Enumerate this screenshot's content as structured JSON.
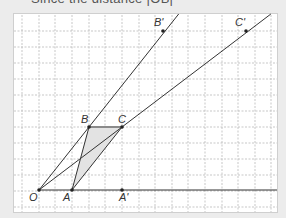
{
  "caption": "Since the distance |OB|",
  "diagram": {
    "type": "geometry-enlargement",
    "grid": {
      "x_lines": [
        22,
        39,
        55,
        72,
        89,
        105,
        122,
        139,
        155,
        172,
        188,
        205,
        222,
        238,
        255,
        271
      ],
      "y_lines": [
        31,
        47,
        63,
        79,
        95,
        111,
        127,
        143,
        159,
        175,
        191,
        207
      ],
      "color": "#b9b9b9"
    },
    "points": {
      "O": {
        "label": "O",
        "x": 39,
        "y": 190
      },
      "A": {
        "label": "A",
        "x": 72,
        "y": 190
      },
      "B": {
        "label": "B",
        "x": 89,
        "y": 127
      },
      "C": {
        "label": "C",
        "x": 122,
        "y": 127
      },
      "A_prime": {
        "label": "A'",
        "x": 122,
        "y": 190
      },
      "B_prime": {
        "label": "B'",
        "x": 163,
        "y": 31
      },
      "C_prime": {
        "label": "C'",
        "x": 246,
        "y": 31
      }
    },
    "triangle_fill": "#e3e3e3",
    "line_color": "#333333",
    "bc_color": "#8a8a8a"
  }
}
